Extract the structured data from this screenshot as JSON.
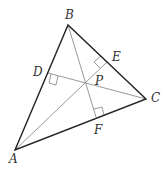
{
  "diagram": {
    "colors": {
      "side": "#222222",
      "altitude": "#9a9a9a",
      "label": "#333333"
    },
    "vertices": {
      "A": {
        "label": "A",
        "x": 15,
        "y": 150
      },
      "B": {
        "label": "B",
        "x": 68,
        "y": 25
      },
      "C": {
        "label": "C",
        "x": 146,
        "y": 99
      }
    },
    "feet": {
      "D": {
        "label": "D",
        "x": 48,
        "y": 73
      },
      "E": {
        "label": "E",
        "x": 107,
        "y": 62
      },
      "F": {
        "label": "F",
        "x": 96,
        "y": 117
      }
    },
    "intersection": {
      "label": "P",
      "x": 82,
      "y": 86
    },
    "right_angle_marks": [
      "D",
      "E",
      "F"
    ]
  }
}
